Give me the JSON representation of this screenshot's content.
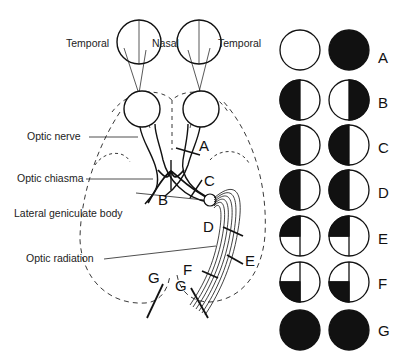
{
  "diagram": {
    "eye_labels": {
      "left_temporal": "Temporal",
      "nasal": "Nasal",
      "right_temporal": "Temporal"
    },
    "structure_labels": {
      "optic_nerve": "Optic nerve",
      "optic_chiasma": "Optic chiasma",
      "lateral_geniculate_body": "Lateral geniculate body",
      "optic_radiation": "Optic radiation"
    },
    "lesion_labels": {
      "A": "A",
      "B": "B",
      "C": "C",
      "D": "D",
      "E": "E",
      "F": "F",
      "G1": "G",
      "G2": "G"
    },
    "field_defects": [
      {
        "label": "A",
        "left": "normal (white)",
        "right": "fully black"
      },
      {
        "label": "B",
        "left": "left half black",
        "right": "right half black"
      },
      {
        "label": "C",
        "left": "left half black",
        "right": "left half black"
      },
      {
        "label": "D",
        "left": "left half black",
        "right": "left half black"
      },
      {
        "label": "E",
        "left": "upper-left quadrant black",
        "right": "upper-left quadrant black"
      },
      {
        "label": "F",
        "left": "lower-left quadrant black",
        "right": "lower-left quadrant black"
      },
      {
        "label": "G",
        "left": "fully black",
        "right": "fully black"
      }
    ]
  }
}
